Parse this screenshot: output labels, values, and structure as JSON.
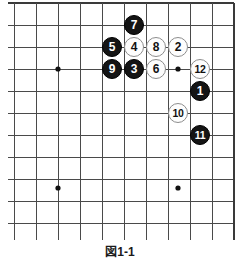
{
  "figure": {
    "kind": "go-board-diagram",
    "caption": "図1-1"
  },
  "board": {
    "cell_size": 22,
    "origin_x": 14,
    "origin_y": 25,
    "cols": 11,
    "rows": 10,
    "line_color": "#4a4a4a",
    "border_color": "#3a3a3a",
    "background_color": "#ffffff",
    "star_point_color": "#111111",
    "star_points": [
      {
        "cx": 58,
        "cy": 69
      },
      {
        "cx": 178,
        "cy": 69
      },
      {
        "cx": 58,
        "cy": 188
      },
      {
        "cx": 178,
        "cy": 188
      }
    ]
  },
  "colors": {
    "black_stone": "#141414",
    "white_stone": "#fdfdfd",
    "white_stone_outline": "#8d8d8d",
    "black_label": "#ffffff",
    "white_label": "#111111"
  },
  "stones": [
    {
      "move": "7",
      "color": "black",
      "x": 134,
      "y": 25
    },
    {
      "move": "5",
      "color": "black",
      "x": 112,
      "y": 47
    },
    {
      "move": "4",
      "color": "white",
      "x": 134,
      "y": 47
    },
    {
      "move": "8",
      "color": "white",
      "x": 156,
      "y": 47
    },
    {
      "move": "2",
      "color": "white",
      "x": 178,
      "y": 47
    },
    {
      "move": "9",
      "color": "black",
      "x": 112,
      "y": 69
    },
    {
      "move": "3",
      "color": "black",
      "x": 134,
      "y": 69
    },
    {
      "move": "6",
      "color": "white",
      "x": 156,
      "y": 69
    },
    {
      "move": "12",
      "color": "white",
      "x": 200,
      "y": 69
    },
    {
      "move": "1",
      "color": "black",
      "x": 200,
      "y": 91
    },
    {
      "move": "10",
      "color": "white",
      "x": 178,
      "y": 113
    },
    {
      "move": "11",
      "color": "black",
      "x": 200,
      "y": 135
    }
  ]
}
